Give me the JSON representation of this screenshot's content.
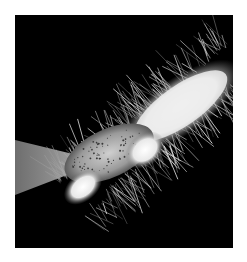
{
  "image": {
    "subject": "scanning electron micrograph of a hairy arthropod leg segment",
    "alt": "Black-and-white micrograph of a bristly, segmented appendage extending diagonally from lower-left to upper-right, with a grey tapered stalk at left and a stippled oval segment at center",
    "palette": {
      "background": "#000000",
      "page": "#ffffff",
      "highlight": "#f4f4f4",
      "midtone": "#9a9a9a",
      "stalk": "#8c8c8c"
    }
  }
}
